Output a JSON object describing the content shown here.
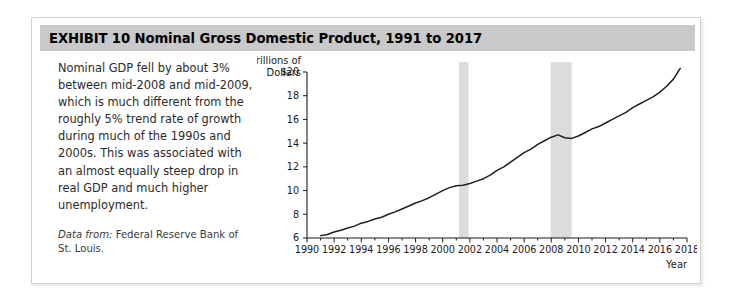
{
  "exhibit": {
    "header": "EXHIBIT 10   Nominal Gross Domestic Product, 1991 to 2017",
    "caption_body": "Nominal GDP fell by about 3% between mid-2008 and mid-2009, which is much different from the roughly 5% trend rate of growth during much of the 1990s and 2000s. This was associated with an almost equally steep drop in real GDP and much higher unemployment.",
    "source_label": "Data from:",
    "source_text": " Federal Reserve Bank of St. Louis."
  },
  "colors": {
    "header_bar": "#c9c9c9",
    "frame_border": "#d2d2d2",
    "line": "#1f1f1f",
    "recession_band": "#dcdcdc",
    "axis": "#1a1a1a"
  },
  "chart_data": {
    "type": "line",
    "title": "Nominal Gross Domestic Product, 1991 to 2017",
    "xlabel": "Year",
    "ylabel": "Trillions of Dollars",
    "ylabel_line1": "Trillions of",
    "ylabel_line2": "Dollars",
    "xlim": [
      1990,
      2018
    ],
    "ylim": [
      6,
      20
    ],
    "grid": false,
    "legend": "none",
    "ytick_labels": [
      "$20",
      "18",
      "16",
      "14",
      "12",
      "10",
      "8",
      "6"
    ],
    "yticks": [
      20,
      18,
      16,
      14,
      12,
      10,
      8,
      6
    ],
    "xticks": [
      1990,
      1992,
      1994,
      1996,
      1998,
      2000,
      2002,
      2004,
      2006,
      2008,
      2010,
      2012,
      2014,
      2016,
      2018
    ],
    "xtick_labels": [
      "1990",
      "1992",
      "1994",
      "1996",
      "1998",
      "2000",
      "2002",
      "2004",
      "2006",
      "2008",
      "2010",
      "2012",
      "2014",
      "2016",
      "2018"
    ],
    "x_minor_step": 1,
    "series": [
      {
        "name": "Nominal GDP",
        "units": "Trillions of Dollars",
        "x": [
          1991,
          1991.5,
          1992,
          1992.5,
          1993,
          1993.5,
          1994,
          1994.5,
          1995,
          1995.5,
          1996,
          1996.5,
          1997,
          1997.5,
          1998,
          1998.5,
          1999,
          1999.5,
          2000,
          2000.5,
          2001,
          2001.5,
          2002,
          2002.5,
          2003,
          2003.5,
          2004,
          2004.5,
          2005,
          2005.5,
          2006,
          2006.5,
          2007,
          2007.5,
          2008,
          2008.5,
          2009,
          2009.5,
          2010,
          2010.5,
          2011,
          2011.5,
          2012,
          2012.5,
          2013,
          2013.5,
          2014,
          2014.5,
          2015,
          2015.5,
          2016,
          2016.5,
          2017,
          2017.5
        ],
        "values": [
          6.2,
          6.3,
          6.5,
          6.65,
          6.85,
          7.0,
          7.25,
          7.4,
          7.6,
          7.75,
          8.0,
          8.2,
          8.45,
          8.7,
          8.95,
          9.15,
          9.4,
          9.7,
          10.0,
          10.25,
          10.4,
          10.45,
          10.6,
          10.8,
          11.0,
          11.3,
          11.7,
          12.0,
          12.4,
          12.8,
          13.2,
          13.5,
          13.9,
          14.2,
          14.5,
          14.7,
          14.45,
          14.4,
          14.6,
          14.9,
          15.2,
          15.4,
          15.7,
          16.0,
          16.3,
          16.6,
          17.0,
          17.3,
          17.6,
          17.9,
          18.3,
          18.8,
          19.4,
          20.3
        ],
        "description": "Nominal GDP rising from about $6.2T in 1991 to about $20.3T in 2017, with a dip during the 2008-2009 recession"
      }
    ],
    "annotations": [
      {
        "type": "recession_band",
        "label": "2001 recession",
        "x_start": 2001.2,
        "x_end": 2001.9
      },
      {
        "type": "recession_band",
        "label": "2007-2009 recession",
        "x_start": 2007.95,
        "x_end": 2009.5
      }
    ]
  }
}
